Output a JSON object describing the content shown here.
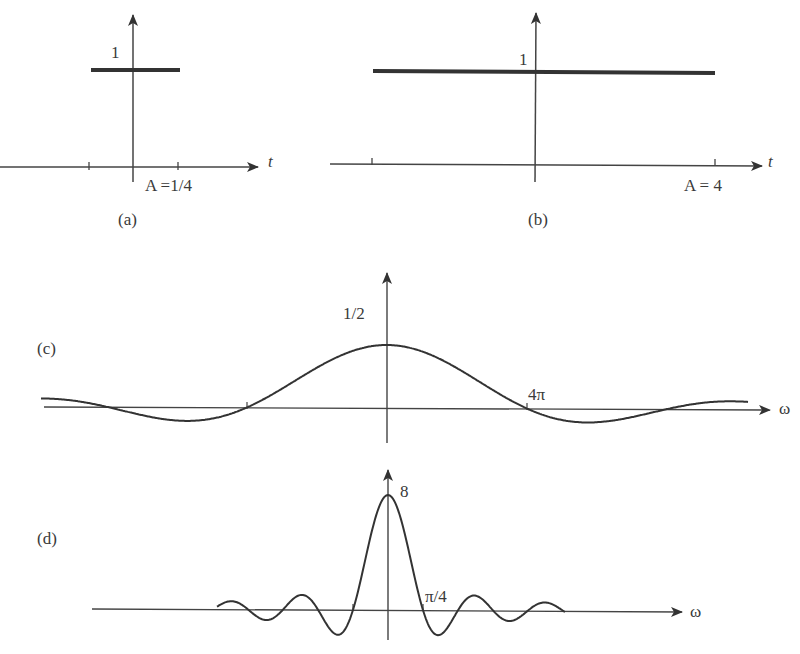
{
  "chart_data": [
    {
      "id": "a",
      "type": "line",
      "caption": "(a)",
      "title": "Rectangular pulse, A = 1/4",
      "xlabel": "t",
      "ylabel": "",
      "height_label": "1",
      "tick_label": "A =1/4",
      "x": [
        -0.25,
        0.25
      ],
      "values": [
        1,
        1
      ],
      "width_A": 0.25,
      "height": 1
    },
    {
      "id": "b",
      "type": "line",
      "caption": "(b)",
      "title": "Rectangular pulse, A = 4",
      "xlabel": "t",
      "ylabel": "",
      "height_label": "1",
      "tick_label": "A = 4",
      "x": [
        -4,
        4
      ],
      "values": [
        1,
        1
      ],
      "width_A": 4,
      "height": 1
    },
    {
      "id": "c",
      "type": "line",
      "caption": "(c)",
      "title": "Spectrum of pulse (a): sinc",
      "xlabel": "ω",
      "peak_label": "1/2",
      "zero_label": "4π",
      "peak_value": 0.5,
      "first_zero": "4π",
      "x_range": [
        "-12π",
        "12π"
      ]
    },
    {
      "id": "d",
      "type": "line",
      "caption": "(d)",
      "title": "Spectrum of pulse (b): sinc",
      "xlabel": "ω",
      "peak_label": "8",
      "zero_label": "π/4",
      "peak_value": 8,
      "first_zero": "π/4",
      "x_range": [
        "-5π/4",
        "5π/4"
      ]
    }
  ],
  "labels": {
    "a": {
      "caption": "(a)",
      "one": "1",
      "tick": "A =1/4",
      "axis": "t"
    },
    "b": {
      "caption": "(b)",
      "one": "1",
      "tick": "A = 4",
      "axis": "t"
    },
    "c": {
      "caption": "(c)",
      "peak": "1/2",
      "zero": "4π",
      "axis": "ω"
    },
    "d": {
      "caption": "(d)",
      "peak": "8",
      "zero": "π/4",
      "axis": "ω"
    }
  },
  "colors": {
    "ink": "#333333",
    "background": "#ffffff"
  }
}
